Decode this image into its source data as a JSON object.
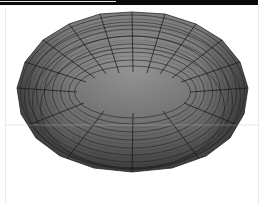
{
  "image": {
    "subject": "shaded polygonal torus",
    "description": "3D torus rendered with flat-shaded quad facets and grid lines, viewed from above at an angle",
    "colors": {
      "background": "#ffffff",
      "top_bar": "#0a0a0a",
      "surface_light": "#9a9a9a",
      "surface_mid": "#6e6e6e",
      "surface_dark": "#2e2e2e",
      "grid_lines": "#1e1e1e",
      "frame": "#ececec"
    },
    "torus": {
      "outer_bounds": {
        "x": 17,
        "y": 12,
        "width": 231,
        "height": 160
      },
      "hole_bounds": {
        "x": 77,
        "y": 72,
        "width": 113,
        "height": 41
      },
      "major_segments": 16,
      "minor_segments": 12
    }
  }
}
